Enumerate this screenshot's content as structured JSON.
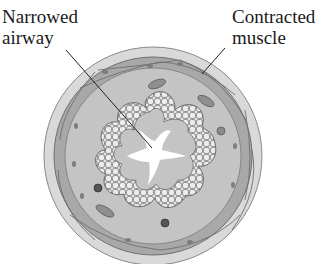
{
  "diagram": {
    "labels": {
      "left": {
        "line1": "Narrowed",
        "line2": "airway"
      },
      "right": {
        "line1": "Contracted",
        "line2": "muscle"
      }
    },
    "colors": {
      "outer_ring": "#d6d6d6",
      "muscle_band": "#a9a9a9",
      "tissue": "#c2c2c2",
      "epithelium_cell": "#e4e4e4",
      "lumen": "#ffffff",
      "outline": "#6a6a6a",
      "leader_line": "#222222"
    }
  }
}
